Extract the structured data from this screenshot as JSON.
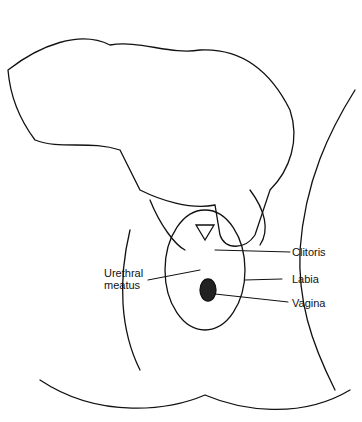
{
  "figure": {
    "type": "clinical line illustration",
    "labels": [
      {
        "id": "clitoris",
        "text": "Clitoris"
      },
      {
        "id": "urethral",
        "text": "Urethral\nmeatus"
      },
      {
        "id": "labia",
        "text": "Labia"
      },
      {
        "id": "vagina",
        "text": "Vagina"
      }
    ]
  }
}
